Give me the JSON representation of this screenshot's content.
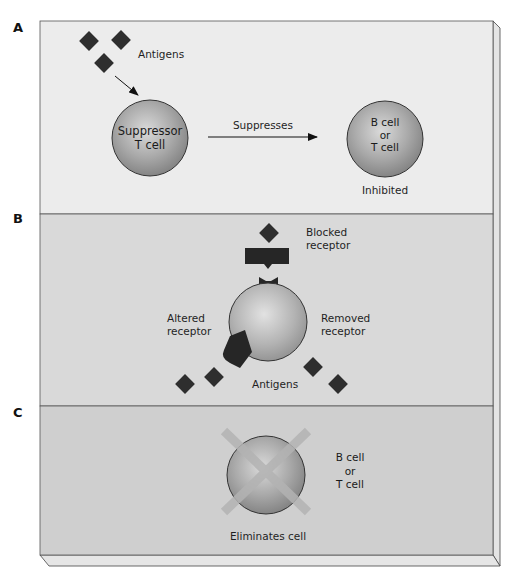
{
  "figure": {
    "panels": [
      {
        "id": "A",
        "letter": "A",
        "background": "#ececec",
        "antigens_label": "Antigens",
        "suppressor_cell_line1": "Suppressor",
        "suppressor_cell_line2": "T cell",
        "arrow_label": "Suppresses",
        "target_cell_line1": "B cell",
        "target_cell_line2": "or",
        "target_cell_line3": "T cell",
        "target_status": "Inhibited"
      },
      {
        "id": "B",
        "letter": "B",
        "background": "#d9d9d9",
        "blocked_line1": "Blocked",
        "blocked_line2": "receptor",
        "altered_line1": "Altered",
        "altered_line2": "receptor",
        "removed_line1": "Removed",
        "removed_line2": "receptor",
        "antigens_label": "Antigens"
      },
      {
        "id": "C",
        "letter": "C",
        "background": "#cfcfcf",
        "cell_line1": "B cell",
        "cell_line2": "or",
        "cell_line3": "T cell",
        "caption": "Eliminates cell"
      }
    ],
    "colors": {
      "antigen": "#2e2e2e",
      "cell_light": "#d6d6d6",
      "cell_dark": "#8a8a8a",
      "cross": "#a8a8a8",
      "frame": "#555555"
    }
  }
}
